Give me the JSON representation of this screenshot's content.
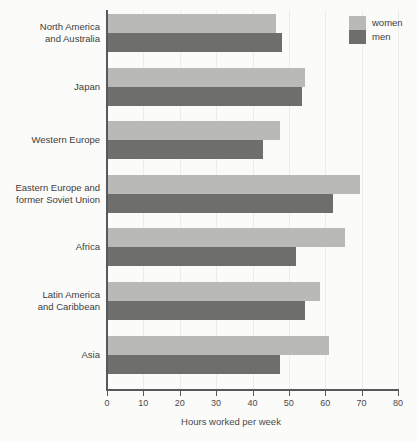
{
  "chart_data": {
    "type": "bar",
    "orientation": "horizontal",
    "title": "",
    "xlabel": "Hours worked per week",
    "ylabel": "",
    "xlim": [
      0,
      80
    ],
    "xticks": [
      0,
      10,
      20,
      30,
      40,
      50,
      60,
      70,
      80
    ],
    "grid": true,
    "legend_position": "top-right",
    "categories": [
      "North America and Australia",
      "Japan",
      "Western Europe",
      "Eastern Europe and former Soviet Union",
      "Africa",
      "Latin America and Caribbean",
      "Asia"
    ],
    "category_lines": [
      [
        "North America",
        "and Australia"
      ],
      [
        "Japan"
      ],
      [
        "Western Europe"
      ],
      [
        "Eastern Europe and",
        "former Soviet Union"
      ],
      [
        "Africa"
      ],
      [
        "Latin America",
        "and Caribbean"
      ],
      [
        "Asia"
      ]
    ],
    "series": [
      {
        "name": "women",
        "color": "#b9b9b7",
        "values": [
          46.5,
          54.5,
          47.5,
          69.5,
          65.5,
          58.5,
          61.0
        ]
      },
      {
        "name": "men",
        "color": "#6e6e6c",
        "values": [
          48.0,
          53.5,
          43.0,
          62.0,
          52.0,
          54.5,
          47.5
        ]
      }
    ]
  },
  "legend": {
    "items": [
      {
        "label": "women",
        "swatch": "women"
      },
      {
        "label": "men",
        "swatch": "men"
      }
    ]
  },
  "axis": {
    "x_title": "Hours worked per week"
  }
}
